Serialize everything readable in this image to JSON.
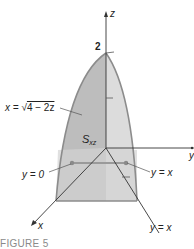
{
  "figure": {
    "caption": "FIGURE 5",
    "axes": {
      "z_label": "z",
      "y_label": "y",
      "x_label": "x",
      "z_tick_label": "2"
    },
    "region_label": {
      "main": "S",
      "subscript": "xz"
    },
    "annotations": {
      "curve_lhs": "x = ",
      "curve_root": "√",
      "curve_radicand": "4 − 2z",
      "left_bound": "y = 0",
      "right_bound": "y = x",
      "bottom_line": "y = x"
    },
    "colors": {
      "dark_face": "#b9b9b9",
      "light_face": "#dcdcdc",
      "base_face": "#cfcfcf",
      "edge": "#8c8c8c",
      "axis": "#333333",
      "bar": "#9a9a9a"
    }
  }
}
